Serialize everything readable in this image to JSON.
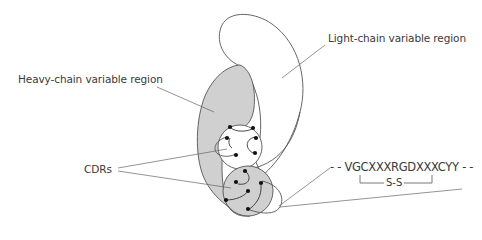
{
  "labels": {
    "light_chain": "Light-chain variable region",
    "heavy_chain": "Heavy-chain variable region",
    "cdrs": "CDRs",
    "sequence": "- - VGCXXXRGDXXXCYY - -",
    "disulfide": "S-S"
  },
  "colors": {
    "outline": "#555555",
    "heavy_fill": "#d0d0d0",
    "light_fill": "#ffffff",
    "leader_line": "#666666",
    "dot": "#111111",
    "text": "#3a3a3a"
  }
}
